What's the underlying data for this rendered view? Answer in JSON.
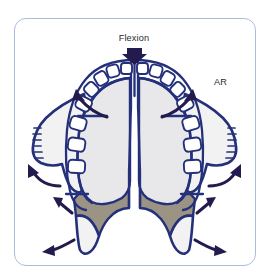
{
  "figure": {
    "type": "anatomical-diagram",
    "panel": {
      "border_color": "#a9bede",
      "background_color": "#ffffff",
      "corner_radius_px": 12
    },
    "labels": {
      "flexion": "Flexion",
      "ar": "AR"
    },
    "colors": {
      "outline_blue": "#25307a",
      "arrow_navy": "#231b4e",
      "bone_light": "#f2f2f3",
      "palate_gray": "#e8e8ea",
      "pterygoid_taupe": "#9b9384",
      "tooth_white": "#ffffff"
    },
    "arrows": [
      {
        "name": "flexion-arrow",
        "direction": "down",
        "style": "solid-block",
        "label": "Flexion"
      },
      {
        "name": "ar-arrow-left",
        "direction": "up-left",
        "style": "curved-line"
      },
      {
        "name": "ar-arrow-right",
        "direction": "up-right",
        "style": "curved-line",
        "label": "AR"
      },
      {
        "name": "expansion-arrow-mid-left",
        "direction": "up-left",
        "style": "curved-line"
      },
      {
        "name": "expansion-arrow-mid-right",
        "direction": "up-right",
        "style": "curved-line"
      },
      {
        "name": "expansion-arrow-inner-left",
        "direction": "up-left",
        "style": "straight-line"
      },
      {
        "name": "expansion-arrow-inner-right",
        "direction": "up-right",
        "style": "straight-line"
      },
      {
        "name": "expansion-arrow-bottom-left",
        "direction": "down-left",
        "style": "curved-line"
      },
      {
        "name": "expansion-arrow-bottom-right",
        "direction": "down-right",
        "style": "curved-line"
      }
    ],
    "teeth": {
      "left_count": 8,
      "right_count": 8,
      "shape": "rounded-rectangle"
    }
  }
}
